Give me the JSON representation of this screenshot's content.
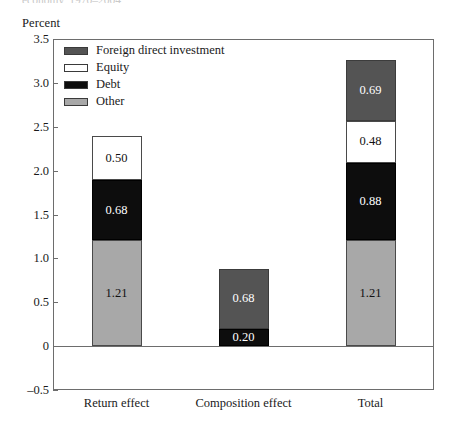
{
  "title_remnant": "economy, 1970–2004",
  "axis_unit": "Percent",
  "chart_data": {
    "type": "bar",
    "subtype": "stacked-bar",
    "title": "",
    "xlabel": "",
    "ylabel": "Percent",
    "ylim": [
      -0.5,
      3.5
    ],
    "ytick_values": [
      -0.5,
      0,
      0.5,
      1.0,
      1.5,
      2.0,
      2.5,
      3.0,
      3.5
    ],
    "ytick_labels": [
      "–0.5",
      "0",
      "0.5",
      "1.0",
      "1.5",
      "2.0",
      "2.5",
      "3.0",
      "3.5"
    ],
    "grid": false,
    "legend_position": "upper-left-inside",
    "categories": [
      "Return effect",
      "Composition effect",
      "Total"
    ],
    "series": [
      {
        "name": "Foreign direct investment",
        "key": "fdi",
        "color": "#545454",
        "label_color": "#ffffff",
        "values": [
          0,
          0.68,
          0.69
        ],
        "labels": [
          "",
          "0.68",
          "0.69"
        ]
      },
      {
        "name": "Equity",
        "key": "equity",
        "color": "#ffffff",
        "label_color": "#111111",
        "values": [
          0.5,
          0,
          0.48
        ],
        "labels": [
          "0.50",
          "",
          "0.48"
        ]
      },
      {
        "name": "Debt",
        "key": "debt",
        "color": "#0d0d0d",
        "label_color": "#ffffff",
        "values": [
          0.68,
          0.2,
          0.88
        ],
        "labels": [
          "0.68",
          "0.20",
          "0.88"
        ]
      },
      {
        "name": "Other",
        "key": "other",
        "color": "#a8a8a8",
        "label_color": "#111111",
        "values": [
          1.21,
          0,
          1.21
        ],
        "labels": [
          "1.21",
          "",
          "1.21"
        ]
      }
    ],
    "stack_order_bottom_to_top": [
      "other",
      "debt",
      "equity",
      "fdi"
    ],
    "totals": [
      2.39,
      0.88,
      3.26
    ]
  },
  "legend": {
    "items": [
      {
        "label": "Foreign direct investment",
        "swatch": "fdi"
      },
      {
        "label": "Equity",
        "swatch": "equity"
      },
      {
        "label": "Debt",
        "swatch": "debt"
      },
      {
        "label": "Other",
        "swatch": "other"
      }
    ]
  },
  "ticks": [
    {
      "label": "3.5",
      "value": 3.5
    },
    {
      "label": "3.0",
      "value": 3.0
    },
    {
      "label": "2.5",
      "value": 2.5
    },
    {
      "label": "2.0",
      "value": 2.0
    },
    {
      "label": "1.5",
      "value": 1.5
    },
    {
      "label": "1.0",
      "value": 1.0
    },
    {
      "label": "0.5",
      "value": 0.5
    },
    {
      "label": "0",
      "value": 0
    },
    {
      "label": "–0.5",
      "value": -0.5
    }
  ],
  "categories": [
    {
      "label": "Return effect"
    },
    {
      "label": "Composition effect"
    },
    {
      "label": "Total"
    }
  ]
}
